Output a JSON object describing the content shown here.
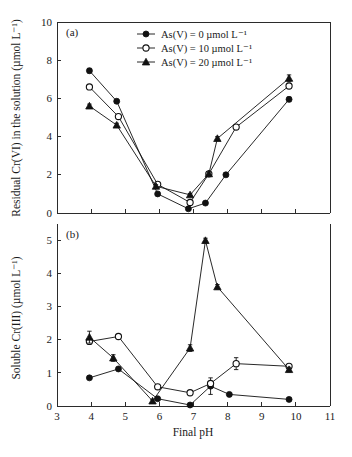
{
  "figure": {
    "width": 352,
    "height": 457,
    "background": "#ffffff",
    "ink_color": "#111111"
  },
  "panels": {
    "a": {
      "label": "(a)"
    },
    "b": {
      "label": "(b)"
    }
  },
  "axis": {
    "x_title": "Final pH",
    "x_ticks": [
      "3",
      "4",
      "5",
      "6",
      "7",
      "8",
      "9",
      "10",
      "11"
    ],
    "y_title_a": "Residual Cr(VI) in the solution (µmol L⁻¹)",
    "y_ticks_a": [
      "0",
      "2",
      "4",
      "6",
      "8",
      "10"
    ],
    "y_title_b": "Soluble Cr(III) (µmol L⁻¹)",
    "y_ticks_b": [
      "0",
      "1",
      "2",
      "3",
      "4",
      "5"
    ]
  },
  "legend": {
    "position": "top-center-of-panel-a",
    "entries": [
      {
        "label": "As(V) = 0 µmol L⁻¹",
        "marker": "filled-circle"
      },
      {
        "label": "As(V) = 10 µmol L⁻¹",
        "marker": "open-circle"
      },
      {
        "label": "As(V) = 20 µmol L⁻¹",
        "marker": "filled-triangle"
      }
    ]
  },
  "chart_data": [
    {
      "type": "line",
      "panel": "(a)",
      "title": "",
      "xlabel": "Final pH",
      "ylabel": "Residual Cr(VI) in the solution (µmol L⁻¹)",
      "xlim": [
        3,
        11
      ],
      "ylim": [
        0,
        10
      ],
      "xticks": [
        3,
        4,
        5,
        6,
        7,
        8,
        9,
        10,
        11
      ],
      "yticks": [
        0,
        2,
        4,
        6,
        8,
        10
      ],
      "grid": false,
      "legend_position": "upper center",
      "series": [
        {
          "name": "As(V) = 0 µmol L⁻¹",
          "marker": "filled-circle",
          "x": [
            3.95,
            4.75,
            5.95,
            6.85,
            7.35,
            7.95,
            9.8
          ],
          "y": [
            7.45,
            5.85,
            1.0,
            0.22,
            0.52,
            2.0,
            5.95
          ],
          "yerr": [
            0.12,
            0.1,
            0.08,
            0.06,
            0.06,
            0.1,
            0.12
          ]
        },
        {
          "name": "As(V) = 10 µmol L⁻¹",
          "marker": "open-circle",
          "x": [
            3.95,
            4.8,
            5.95,
            6.9,
            7.45,
            8.25,
            9.8
          ],
          "y": [
            6.6,
            5.05,
            1.5,
            0.55,
            2.05,
            4.5,
            6.65
          ],
          "yerr": [
            0.1,
            0.1,
            0.08,
            0.07,
            0.1,
            0.1,
            0.12
          ]
        },
        {
          "name": "As(V) = 20 µmol L⁻¹",
          "marker": "filled-triangle",
          "x": [
            3.95,
            4.75,
            5.9,
            6.9,
            7.45,
            7.7,
            9.8
          ],
          "y": [
            5.6,
            4.6,
            1.4,
            0.95,
            2.05,
            3.9,
            7.05
          ],
          "yerr": [
            0.1,
            0.1,
            0.08,
            0.07,
            0.1,
            0.1,
            0.18
          ]
        }
      ]
    },
    {
      "type": "line",
      "panel": "(b)",
      "title": "",
      "xlabel": "Final pH",
      "ylabel": "Soluble Cr(III) (µmol L⁻¹)",
      "xlim": [
        3,
        11
      ],
      "ylim": [
        0,
        5.5
      ],
      "xticks": [
        3,
        4,
        5,
        6,
        7,
        8,
        9,
        10,
        11
      ],
      "yticks": [
        0,
        1,
        2,
        3,
        4,
        5
      ],
      "grid": false,
      "legend_position": "none",
      "series": [
        {
          "name": "As(V) = 0 µmol L⁻¹",
          "marker": "filled-circle",
          "x": [
            3.95,
            4.8,
            5.95,
            6.9,
            7.5,
            8.05,
            9.8
          ],
          "y": [
            0.85,
            1.12,
            0.22,
            0.03,
            0.6,
            0.35,
            0.2
          ],
          "yerr": [
            0.05,
            0.05,
            0.04,
            0.03,
            0.25,
            0.04,
            0.04
          ]
        },
        {
          "name": "As(V) = 10 µmol L⁻¹",
          "marker": "open-circle",
          "x": [
            3.95,
            4.8,
            5.95,
            6.9,
            7.5,
            8.25,
            9.8
          ],
          "y": [
            1.95,
            2.1,
            0.58,
            0.4,
            0.68,
            1.28,
            1.2
          ],
          "yerr": [
            0.07,
            0.06,
            0.05,
            0.04,
            0.05,
            0.18,
            0.06
          ]
        },
        {
          "name": "As(V) = 20 µmol L⁻¹",
          "marker": "filled-triangle",
          "x": [
            3.95,
            4.65,
            5.8,
            6.9,
            7.35,
            7.7,
            9.8
          ],
          "y": [
            2.08,
            1.45,
            0.15,
            1.75,
            5.0,
            3.6,
            1.1
          ],
          "yerr": [
            0.18,
            0.1,
            0.05,
            0.1,
            0.07,
            0.07,
            0.07
          ]
        }
      ]
    }
  ]
}
